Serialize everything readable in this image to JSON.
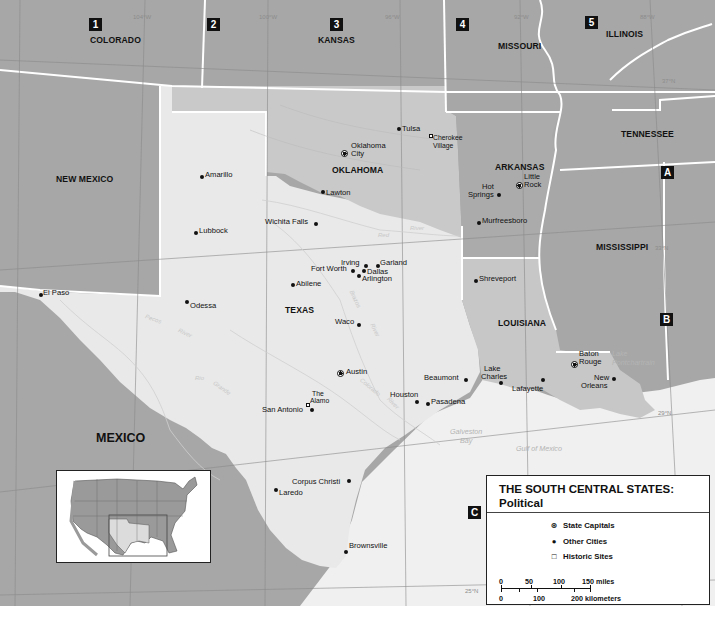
{
  "map": {
    "title_line1": "THE SOUTH CENTRAL STATES:",
    "title_line2": "Political",
    "colors": {
      "region_states": "#e9e9e9",
      "neighbor_states": "#a7a7a7",
      "oklahoma_louisiana": "#c7c7c7",
      "arkansas": "#a9a9a9",
      "water": "#f0f0f0",
      "border": "#ffffff",
      "ink": "#111111"
    },
    "grid_markers": {
      "col_1": "1",
      "col_2": "2",
      "col_3": "3",
      "col_4": "4",
      "col_5": "5",
      "row_a": "A",
      "row_b": "B",
      "row_c": "C"
    },
    "states": {
      "colorado": "COLORADO",
      "kansas": "KANSAS",
      "missouri": "MISSOURI",
      "illinois": "ILLINOIS",
      "tennessee": "TENNESSEE",
      "new_mexico": "NEW MEXICO",
      "oklahoma": "OKLAHOMA",
      "arkansas": "ARKANSAS",
      "mississippi": "MISSISSIPPI",
      "texas": "TEXAS",
      "louisiana": "LOUISIANA"
    },
    "countries": {
      "mexico": "MEXICO"
    },
    "water_bodies": {
      "gulf": "Gulf of Mexico",
      "galveston_1": "Galveston",
      "galveston_2": "Bay",
      "lake_pontchartrain_1": "Lake",
      "lake_pontchartrain_2": "Pontchartrain"
    },
    "rivers": {
      "pecos_1": "Pecos",
      "pecos_2": "River",
      "rio_grande_1": "Rio",
      "rio_grande_2": "Grande",
      "red_1": "Red",
      "red_2": "River",
      "brazos_1": "Brazos",
      "brazos_2": "River",
      "colorado_1": "Colorado",
      "colorado_2": "River"
    },
    "graticule": {
      "lon_104": "104°W",
      "lon_100": "100°W",
      "lon_96": "96°W",
      "lon_92": "92°W",
      "lon_88": "88°W",
      "lat_37": "37°N",
      "lat_33": "33°N",
      "lat_29": "29°N",
      "lat_25": "25°N"
    },
    "capitals": {
      "oklahoma_city_1": "Oklahoma",
      "oklahoma_city_2": "City",
      "little_rock_1": "Little",
      "little_rock_2": "Rock",
      "austin": "Austin",
      "baton_rouge_1": "Baton",
      "baton_rouge_2": "Rouge"
    },
    "cities": {
      "tulsa": "Tulsa",
      "lawton": "Lawton",
      "hot_springs_1": "Hot",
      "hot_springs_2": "Springs",
      "murfreesboro": "Murfreesboro",
      "amarillo": "Amarillo",
      "lubbock": "Lubbock",
      "wichita_falls": "Wichita Falls",
      "irving": "Irving",
      "garland": "Garland",
      "fort_worth": "Fort Worth",
      "dallas": "Dallas",
      "arlington": "Arlington",
      "abilene": "Abilene",
      "el_paso": "El Paso",
      "odessa": "Odessa",
      "waco": "Waco",
      "shreveport": "Shreveport",
      "beaumont": "Beaumont",
      "lake_charles_1": "Lake",
      "lake_charles_2": "Charles",
      "lafayette": "Lafayette",
      "new_orleans_1": "New",
      "new_orleans_2": "Orleans",
      "houston": "Houston",
      "pasadena": "Pasadena",
      "san_antonio": "San Antonio",
      "corpus_christi": "Corpus Christi",
      "laredo": "Laredo",
      "brownsville": "Brownsville"
    },
    "historic_sites": {
      "cherokee_village_1": "Cherokee",
      "cherokee_village_2": "Village",
      "the_alamo_1": "The",
      "the_alamo_2": "Alamo"
    },
    "legend": {
      "capitals_label": "State Capitals",
      "other_cities_label": "Other Cities",
      "historic_sites_label": "Historic Sites",
      "miles_ticks": [
        "0",
        "50",
        "100",
        "150 miles"
      ],
      "km_ticks": [
        "0",
        "100",
        "200 kilometers"
      ]
    }
  }
}
